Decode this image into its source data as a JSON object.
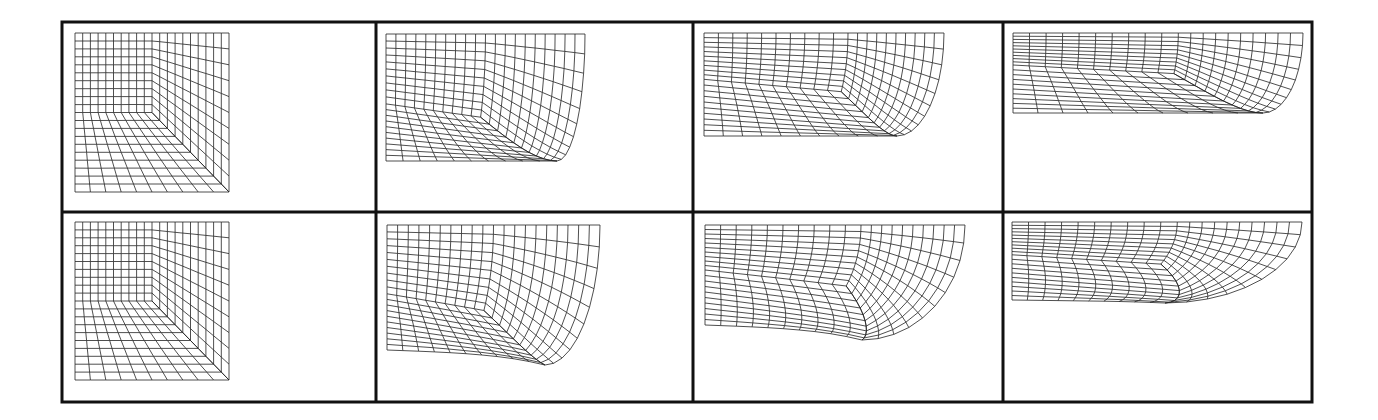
{
  "figure": {
    "colors": {
      "frame": "#111111",
      "mesh": "#222222",
      "background": "#ffffff"
    },
    "frame": {
      "left": 62,
      "top": 22,
      "right": 1312,
      "bottom": 402,
      "col_dividers": [
        376,
        693,
        1003
      ],
      "row_divider": 212,
      "stroke_width": 3
    },
    "mesh_resolution": {
      "cells_per_side": 20,
      "corner_index": 10
    },
    "rows": [
      {
        "name": "top-row",
        "panels": [
          {
            "name": "stage-1",
            "x0": 75,
            "x1": 229,
            "y0": 33,
            "y1": 192,
            "bulge": 0,
            "tip": [
              229,
              192
            ],
            "rightBottomY": 192,
            "sag": 0,
            "cornerFrac": [
              0.5,
              0.5
            ]
          },
          {
            "name": "stage-2",
            "x0": 386,
            "x1": 585,
            "y0": 34,
            "y1": 161,
            "bulge": 0.0,
            "tip": [
              557,
              161
            ],
            "rightBottomY": 110,
            "sag": 0,
            "cornerFrac": [
              0.5,
              0.55
            ]
          },
          {
            "name": "stage-3",
            "x0": 704,
            "x1": 944,
            "y0": 33,
            "y1": 136,
            "bulge": 0.0,
            "tip": [
              897,
              136
            ],
            "rightBottomY": 85,
            "sag": 0,
            "cornerFrac": [
              0.6,
              0.45
            ]
          },
          {
            "name": "stage-4",
            "x0": 1013,
            "x1": 1303,
            "y0": 33,
            "y1": 113,
            "bulge": 0.0,
            "tip": [
              1263,
              113
            ],
            "rightBottomY": 65,
            "sag": 0,
            "cornerFrac": [
              0.57,
              0.4
            ]
          }
        ]
      },
      {
        "name": "bottom-row",
        "panels": [
          {
            "name": "stage-1",
            "x0": 75,
            "x1": 229,
            "y0": 222,
            "y1": 380,
            "bulge": 0,
            "tip": [
              229,
              380
            ],
            "rightBottomY": 380,
            "sag": 0,
            "cornerFrac": [
              0.5,
              0.5
            ]
          },
          {
            "name": "stage-2",
            "x0": 387,
            "x1": 600,
            "y0": 225,
            "y1": 350,
            "bulge": 0.0,
            "tip": [
              545,
              365
            ],
            "rightBottomY": 300,
            "sag": 6,
            "cornerFrac": [
              0.5,
              0.55
            ]
          },
          {
            "name": "stage-3",
            "x0": 705,
            "x1": 965,
            "y0": 225,
            "y1": 325,
            "bulge": 0.0,
            "tip": [
              862,
              340
            ],
            "rightBottomY": 290,
            "sag": 6,
            "cornerFrac": [
              0.6,
              0.45
            ]
          },
          {
            "name": "stage-4",
            "x0": 1012,
            "x1": 1302,
            "y0": 222,
            "y1": 300,
            "bulge": 0.0,
            "tip": [
              1165,
              303
            ],
            "rightBottomY": 295,
            "sag": 2,
            "cornerFrac": [
              0.57,
              0.42
            ]
          }
        ]
      }
    ]
  }
}
